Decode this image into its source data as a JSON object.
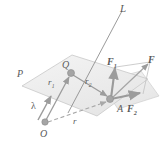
{
  "figure": {
    "type": "vector-diagram",
    "background_color": "#ffffff",
    "stroke_color": "#8a8a8a",
    "plane_fill": "#f0f0f0",
    "node_color": "#9a9a9a",
    "labels": {
      "line": "L",
      "plane": "P",
      "point_q": "Q",
      "point_o": "O",
      "point_a": "A",
      "vector_r1_base": "r",
      "vector_r1_sub": "1",
      "vector_r2_base": "r",
      "vector_r2_sub": "2",
      "vector_r": "r",
      "unit_vector_lambda": "λ",
      "force_f": "F",
      "force_f1_base": "F",
      "force_f1_sub": "1",
      "force_f2_base": "F",
      "force_f2_sub": "2"
    }
  },
  "geometry": {
    "plane_p_points": "22,86 72,55 148,79 96,115",
    "plane_q_points": "100,82 140,72 158,95 118,108",
    "line_l": {
      "x1": 121,
      "y1": 12,
      "x2": 70,
      "y2": 110
    },
    "point_q": {
      "cx": 71,
      "cy": 72,
      "r": 3.4
    },
    "point_a": {
      "cx": 111,
      "cy": 99,
      "r": 3.4
    },
    "point_o": {
      "cx": 45,
      "cy": 121,
      "r": 3.2
    },
    "vectors": [
      {
        "name": "r1",
        "x1": 45,
        "y1": 121,
        "x2": 70,
        "y2": 74
      },
      {
        "name": "r2",
        "x1": 71,
        "y1": 74,
        "x2": 109,
        "y2": 98
      },
      {
        "name": "lambda",
        "x1": 38,
        "y1": 119,
        "x2": 51,
        "y2": 95
      },
      {
        "name": "r",
        "x1": 46,
        "y1": 122,
        "x2": 108,
        "y2": 101,
        "dashed": true
      },
      {
        "name": "F",
        "x1": 111,
        "y1": 99,
        "x2": 148,
        "y2": 64
      },
      {
        "name": "F1",
        "x1": 111,
        "y1": 99,
        "x2": 116,
        "y2": 66
      },
      {
        "name": "F2",
        "x1": 111,
        "y1": 99,
        "x2": 143,
        "y2": 93
      }
    ]
  }
}
